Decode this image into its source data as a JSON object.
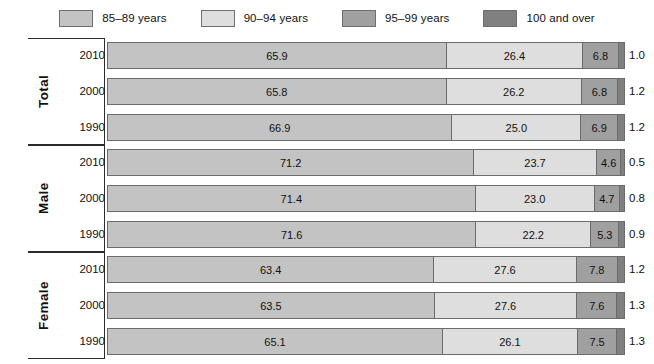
{
  "legend": {
    "items": [
      {
        "label": "85–89 years",
        "color": "#c3c3c3",
        "key": "a85_89"
      },
      {
        "label": "90–94 years",
        "color": "#dedede",
        "key": "a90_94"
      },
      {
        "label": "95–99 years",
        "color": "#a0a0a0",
        "key": "a95_99"
      },
      {
        "label": "100 and over",
        "color": "#808080",
        "key": "a100p"
      }
    ]
  },
  "groups": [
    {
      "name": "Total",
      "rows": [
        {
          "year": "2010",
          "values": [
            65.9,
            26.4,
            6.8,
            1.0
          ],
          "labels": [
            "65.9",
            "26.4",
            "6.8",
            "1.0"
          ],
          "outer": "1.0"
        },
        {
          "year": "2000",
          "values": [
            65.8,
            26.2,
            6.8,
            1.2
          ],
          "labels": [
            "65.8",
            "26.2",
            "6.8",
            "1.2"
          ],
          "outer": "1.2"
        },
        {
          "year": "1990",
          "values": [
            66.9,
            25.0,
            6.9,
            1.2
          ],
          "labels": [
            "66.9",
            "25.0",
            "6.9",
            "1.2"
          ],
          "outer": "1.2"
        }
      ]
    },
    {
      "name": "Male",
      "rows": [
        {
          "year": "2010",
          "values": [
            71.2,
            23.7,
            4.6,
            0.5
          ],
          "labels": [
            "71.2",
            "23.7",
            "4.6",
            "0.5"
          ],
          "outer": "0.5"
        },
        {
          "year": "2000",
          "values": [
            71.4,
            23.0,
            4.7,
            0.8
          ],
          "labels": [
            "71.4",
            "23.0",
            "4.7",
            "0.8"
          ],
          "outer": "0.8"
        },
        {
          "year": "1990",
          "values": [
            71.6,
            22.2,
            5.3,
            0.9
          ],
          "labels": [
            "71.6",
            "22.2",
            "5.3",
            "0.9"
          ],
          "outer": "0.9"
        }
      ]
    },
    {
      "name": "Female",
      "rows": [
        {
          "year": "2010",
          "values": [
            63.4,
            27.6,
            7.8,
            1.2
          ],
          "labels": [
            "63.4",
            "27.6",
            "7.8",
            "1.2"
          ],
          "outer": "1.2"
        },
        {
          "year": "2000",
          "values": [
            63.5,
            27.6,
            7.6,
            1.3
          ],
          "labels": [
            "63.5",
            "27.6",
            "7.6",
            "1.3"
          ],
          "outer": "1.3"
        },
        {
          "year": "1990",
          "values": [
            65.1,
            26.1,
            7.5,
            1.3
          ],
          "labels": [
            "65.1",
            "26.1",
            "7.5",
            "1.3"
          ],
          "outer": "1.3"
        }
      ]
    }
  ],
  "chart_data": {
    "type": "bar",
    "orientation": "horizontal",
    "stacked": true,
    "normalized_percent": true,
    "title": "",
    "subtitle": "",
    "xlabel": "",
    "ylabel": "",
    "xlim": [
      0,
      100
    ],
    "grid": false,
    "legend_position": "top-center",
    "categories": [
      "Total 2010",
      "Total 2000",
      "Total 1990",
      "Male 2010",
      "Male 2000",
      "Male 1990",
      "Female 2010",
      "Female 2000",
      "Female 1990"
    ],
    "series": [
      {
        "name": "85–89 years",
        "color": "#c3c3c3",
        "values": [
          65.9,
          65.8,
          66.9,
          71.2,
          71.4,
          71.6,
          63.4,
          63.5,
          65.1
        ]
      },
      {
        "name": "90–94 years",
        "color": "#dedede",
        "values": [
          26.4,
          26.2,
          25.0,
          23.7,
          23.0,
          22.2,
          27.6,
          27.6,
          26.1
        ]
      },
      {
        "name": "95–99 years",
        "color": "#a0a0a0",
        "values": [
          6.8,
          6.8,
          6.9,
          4.6,
          4.7,
          5.3,
          7.8,
          7.6,
          7.5
        ]
      },
      {
        "name": "100 and over",
        "color": "#808080",
        "values": [
          1.0,
          1.2,
          1.2,
          0.5,
          0.8,
          0.9,
          1.2,
          1.3,
          1.3
        ]
      }
    ],
    "group_labels": [
      "Total",
      "Male",
      "Female"
    ],
    "year_labels": [
      "2010",
      "2000",
      "1990"
    ],
    "annotations": {
      "outer_right_values": [
        "1.0",
        "1.2",
        "1.2",
        "0.5",
        "0.8",
        "0.9",
        "1.2",
        "1.3",
        "1.3"
      ],
      "note": "Right-hand numbers repeat the '100 and over' share, which is too narrow to label inside the bar."
    }
  }
}
